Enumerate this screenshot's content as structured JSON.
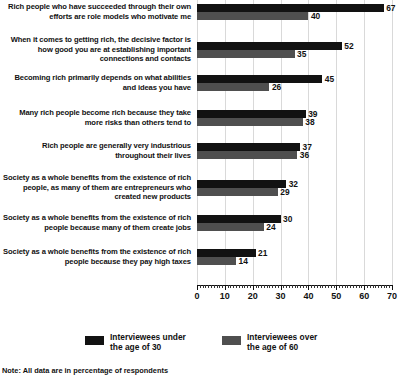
{
  "chart_data": {
    "type": "bar",
    "orientation": "horizontal",
    "title": "",
    "xlabel": "",
    "ylabel": "",
    "xlim": [
      0,
      70
    ],
    "xticks": [
      0,
      10,
      20,
      30,
      40,
      50,
      60,
      70
    ],
    "xtick_labels": [
      "0",
      "10",
      "20",
      "30",
      "40",
      "50",
      "60",
      "70"
    ],
    "grid": true,
    "grid_axis": "x",
    "legend_position": "bottom",
    "note": "Note: All data are in percentage of respondents",
    "categories": [
      "Rich people who have succeeded through their own efforts are role models who motivate me",
      "When it comes to getting rich, the decisive factor is how good you are at establishing important connections and contacts",
      "Becoming rich primarily depends on what abilities and ideas you have",
      "Many rich people become rich because they take more risks than others tend to",
      "Rich people are generally very industrious throughout their lives",
      "Society as a whole benefits from the existence of rich people, as many of them are entrepreneurs who created new products",
      "Society as a whole benefits from the existence of rich people because many of them create jobs",
      "Society as a whole benefits from the existence of rich people because they pay high taxes"
    ],
    "series": [
      {
        "name": "Interviewees under the age of 30",
        "color": "#121212",
        "values": [
          67,
          52,
          45,
          39,
          37,
          32,
          30,
          21
        ]
      },
      {
        "name": "Interviewees over the age of 60",
        "color": "#4f4f4f",
        "values": [
          40,
          35,
          26,
          38,
          36,
          29,
          24,
          14
        ]
      }
    ]
  },
  "legend": {
    "items": [
      {
        "label": "Interviewees under\nthe age of 30",
        "color": "#121212"
      },
      {
        "label": "Interviewees over\nthe age of 60",
        "color": "#4f4f4f"
      }
    ]
  },
  "footnote": "Note: All data are in percentage of respondents",
  "colors": {
    "under30": "#121212",
    "over60": "#4f4f4f",
    "gridline": "#d9d9d9",
    "text": "#111111",
    "background": "#ffffff"
  }
}
